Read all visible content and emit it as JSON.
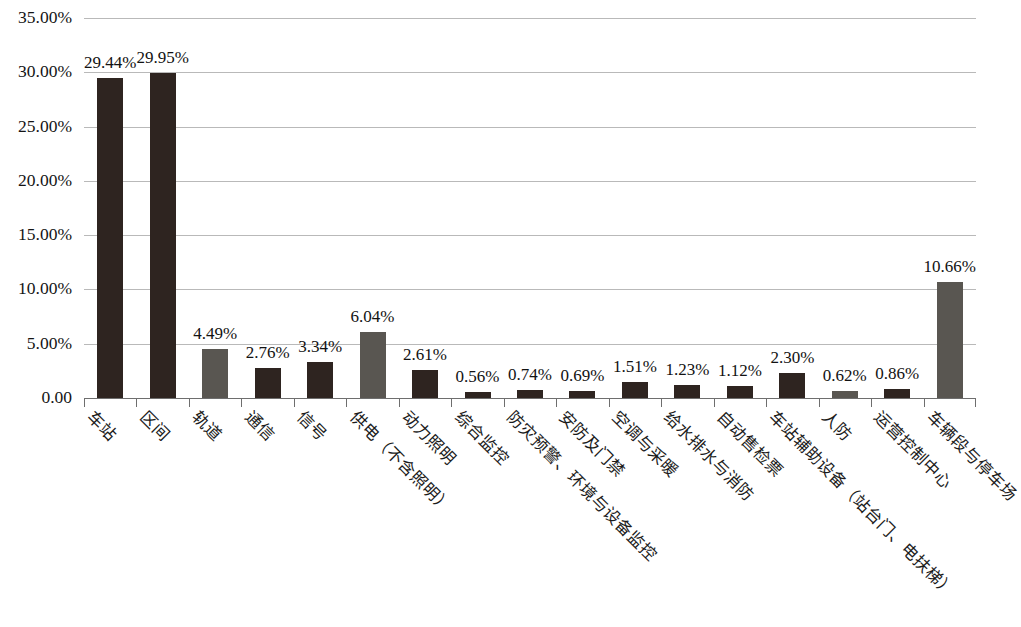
{
  "chart_data": {
    "type": "bar",
    "title": "",
    "subtitle": "",
    "xlabel": "",
    "ylabel": "",
    "ylim": [
      0,
      35
    ],
    "grid": true,
    "legend": "none",
    "y_ticks": [
      "0.00",
      "5.00%",
      "10.00%",
      "15.00%",
      "20.00%",
      "25.00%",
      "30.00%",
      "35.00%"
    ],
    "y_tick_values": [
      0,
      5,
      10,
      15,
      20,
      25,
      30,
      35
    ],
    "categories": [
      "车站",
      "区间",
      "轨道",
      "通信",
      "信号",
      "供电（不含照明）",
      "动力照明",
      "综合监控",
      "防灾预警、环境与设备监控",
      "安防及门禁",
      "空调与采暖",
      "给水排水与消防",
      "自动售检票",
      "车站辅助设备（站台门、电扶梯）",
      "人防",
      "运营控制中心",
      "车辆段与停车场"
    ],
    "values": [
      29.44,
      29.95,
      4.49,
      2.76,
      3.34,
      6.04,
      2.61,
      0.56,
      0.74,
      0.69,
      1.51,
      1.23,
      1.12,
      2.3,
      0.62,
      0.86,
      10.66
    ],
    "value_labels": [
      "29.44%",
      "29.95%",
      "4.49%",
      "2.76%",
      "3.34%",
      "6.04%",
      "2.61%",
      "0.56%",
      "0.74%",
      "0.69%",
      "1.51%",
      "1.23%",
      "1.12%",
      "2.30%",
      "0.62%",
      "0.86%",
      "10.66%"
    ],
    "bar_colors": [
      "dark",
      "dark",
      "gray",
      "dark",
      "dark",
      "gray",
      "dark",
      "dark",
      "dark",
      "dark",
      "dark",
      "dark",
      "dark",
      "dark",
      "gray",
      "dark",
      "gray"
    ],
    "colors": {
      "dark": "#2e2420",
      "gray": "#595651",
      "gridline": "#b9b9b9",
      "axis": "#6e6e6e",
      "background": "#ffffff",
      "text": "#1a1a1a"
    }
  }
}
